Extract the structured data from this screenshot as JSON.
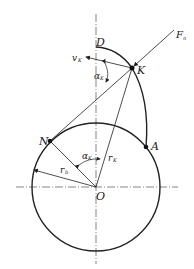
{
  "diagram": {
    "type": "involute-gear-geometry",
    "colors": {
      "stroke": "#222222",
      "background": "#ffffff"
    },
    "points": {
      "O": {
        "label": "O"
      },
      "N": {
        "label": "N"
      },
      "K": {
        "label": "K"
      },
      "A": {
        "label": "A"
      },
      "D": {
        "label": "D"
      }
    },
    "labels": {
      "force": "F",
      "force_sub": "n",
      "velocity": "v",
      "velocity_sub": "K",
      "alpha_k_top": "α",
      "alpha_k_top_sub": "K",
      "alpha_k_center": "α",
      "alpha_k_center_sub": "K",
      "r_k": "r",
      "r_k_sub": "K",
      "r_b": "r",
      "r_b_sub": "b"
    }
  }
}
